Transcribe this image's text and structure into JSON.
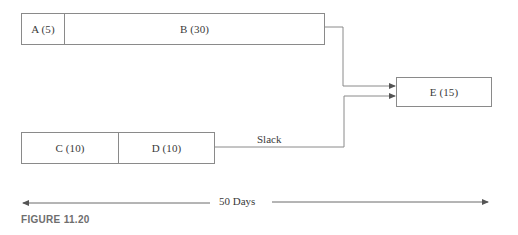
{
  "diagram": {
    "type": "project-schedule-network",
    "activities": [
      {
        "id": "A",
        "duration": 5,
        "label": "A (5)"
      },
      {
        "id": "B",
        "duration": 30,
        "label": "B (30)"
      },
      {
        "id": "C",
        "duration": 10,
        "label": "C (10)"
      },
      {
        "id": "D",
        "duration": 10,
        "label": "D (10)"
      },
      {
        "id": "E",
        "duration": 15,
        "label": "E (15)"
      }
    ],
    "paths": [
      {
        "sequence": [
          "A",
          "B",
          "E"
        ]
      },
      {
        "sequence": [
          "C",
          "D",
          "E"
        ],
        "note": "Slack"
      }
    ],
    "slack_label": "Slack",
    "timeline_label": "50 Days",
    "figure_caption": "FIGURE 11.20"
  },
  "colors": {
    "line": "#8a8a8a",
    "text": "#3a3a3a",
    "caption": "#6e6e6e",
    "background": "#ffffff"
  }
}
